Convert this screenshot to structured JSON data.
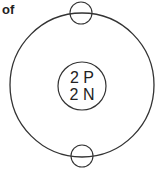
{
  "caption_fragment": "of",
  "diagram": {
    "nucleus": {
      "protons_label": "2 P",
      "neutrons_label": "2 N"
    },
    "electrons": [
      {
        "position": "top"
      },
      {
        "position": "bottom"
      }
    ],
    "colors": {
      "stroke": "#333333",
      "text": "#222222",
      "background": "#ffffff"
    }
  }
}
